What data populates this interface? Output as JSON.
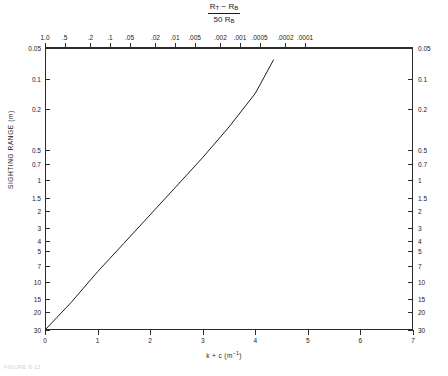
{
  "figure": {
    "top_title_numerator_a": "R",
    "top_title_numerator_a_sub": "T",
    "top_title_minus": " − ",
    "top_title_numerator_b": "R",
    "top_title_numerator_b_sub": "B",
    "top_title_denominator": "50 R",
    "top_title_denominator_sub": "B",
    "caption": "FIGURE 6-12"
  },
  "axes": {
    "y_title": "SIGHTING RANGE (m)",
    "x_title_main": "k + c  (m",
    "x_title_exp": "−1",
    "x_title_tail": ")"
  },
  "chart_data": {
    "type": "line",
    "xlabel": "k + c (m^-1)",
    "ylabel": "SIGHTING RANGE (m)",
    "xlim": [
      0,
      7
    ],
    "ylim_log_inverted": [
      0.05,
      30
    ],
    "grid": false,
    "legend": null,
    "x_ticks": [
      "0",
      "1",
      "2",
      "3",
      "4",
      "5",
      "6",
      "7"
    ],
    "x_tick_values": [
      0,
      1,
      2,
      3,
      4,
      5,
      6,
      7
    ],
    "y_ticks": [
      "0.05",
      "0.1",
      "0.2",
      "0.5",
      "0.7",
      "1",
      "1.5",
      "2",
      "3",
      "4",
      "5",
      "7",
      "10",
      "15",
      "20",
      "30"
    ],
    "y_tick_values": [
      0.05,
      0.1,
      0.2,
      0.5,
      0.7,
      1,
      1.5,
      2,
      3,
      4,
      5,
      7,
      10,
      15,
      20,
      30
    ],
    "top_axis_label": "(R_T - R_B)/(50 R_B)",
    "top_ticks": [
      "1.0",
      ".5",
      ".2",
      ".1",
      ".05",
      ".02",
      ".01",
      ".005",
      ".002",
      ".001",
      ".0005",
      ".0002",
      ".0001"
    ],
    "top_tick_values": [
      1.0,
      0.5,
      0.2,
      0.1,
      0.05,
      0.02,
      0.01,
      0.005,
      0.002,
      0.001,
      0.0005,
      0.0002,
      0.0001
    ],
    "series": [
      {
        "name": "sighting range vs extinction",
        "x": [
          0.0,
          0.5,
          1.0,
          1.5,
          2.0,
          2.5,
          3.0,
          3.5,
          4.0,
          4.35
        ],
        "y": [
          30.0,
          16.0,
          8.0,
          4.2,
          2.2,
          1.15,
          0.6,
          0.3,
          0.14,
          0.065
        ],
        "comment": "straight line on semi-log axes from lower-left origin to upper-right"
      }
    ],
    "annotations": []
  }
}
